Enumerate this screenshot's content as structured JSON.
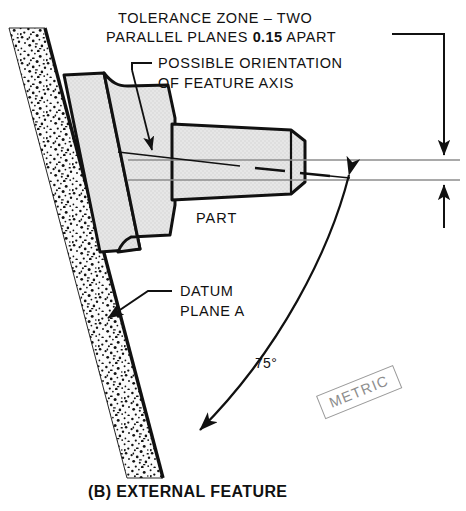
{
  "figure": {
    "caption": "(B) EXTERNAL FEATURE",
    "standard_note": "METRIC"
  },
  "annotations": {
    "tolerance_zone_line1": "TOLERANCE ZONE – TWO",
    "tolerance_zone_line2_pre": "PARALLEL PLANES ",
    "tolerance_zone_value": "0.15",
    "tolerance_zone_line2_post": " APART",
    "possible_orientation_line1": "POSSIBLE ORIENTATION",
    "possible_orientation_line2": "OF FEATURE AXIS",
    "part_label": "PART",
    "datum_line1": "DATUM",
    "datum_line2": "PLANE A",
    "angle_label": "75°"
  },
  "dimensions": {
    "tolerance_value": "0.15",
    "basic_angle": "75°",
    "datum_reference": "A"
  },
  "style": {
    "ink": "#111111",
    "part_fill": "#e3e3e3",
    "stipple_fill": "#f2f2f2",
    "thin_line": "#8c8c8c",
    "metric_border": "#9a9a9a"
  }
}
